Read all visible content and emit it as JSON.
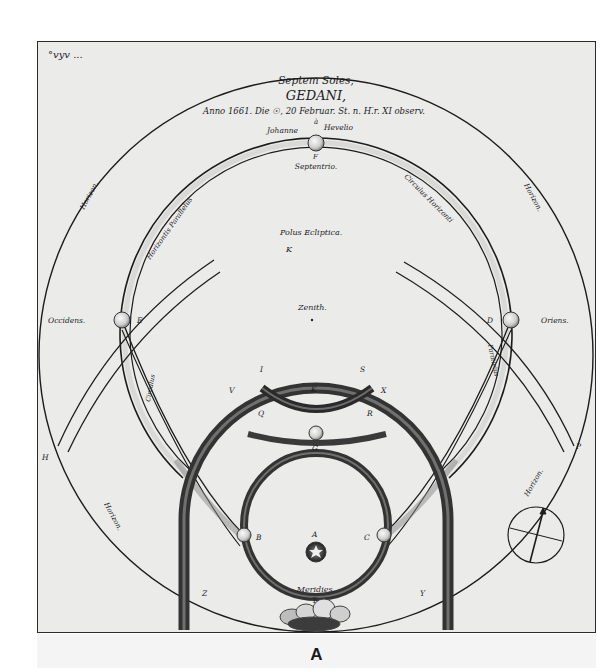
{
  "figure": {
    "caption": "A",
    "corner_inscription": "°vyv ...",
    "title": {
      "line1": "Septem Soles,",
      "line2": "GEDANI,",
      "line3": "Anno 1661. Die ☉, 20 Februar. St. n. H.̅r. XI observ.",
      "line4": "à",
      "author_left": "Johanne",
      "author_right": "Hevelio"
    },
    "labels": {
      "septentrio": "Septentrio.",
      "polus_ecliptica": "Polus Ecliptica.",
      "pole_symbol": "K",
      "zenith": "Zenith.",
      "occidens": "Occidens.",
      "oriens": "Oriens.",
      "meridies": "Meridies.",
      "horizon_upper_left": "Horizon.",
      "horizon_upper_right": "Horizon.",
      "horizon_lower_left": "Horizon.",
      "horizon_lower_right": "Horizon.",
      "horizontis_parallelus": "Horizontis Parallelus",
      "circulus_horizonti": "Circulus Horizonti",
      "circulus_left_lower": "Circulus",
      "parallelus_right_lower": "Parallelus"
    },
    "letters": {
      "top_sun": "F",
      "west_sun": "E",
      "east_sun": "D",
      "arc_left": "I",
      "arc_right": "S",
      "arc_mid": "K",
      "ring_left": "V",
      "ring_right": "X",
      "inner_left": "Q",
      "inner_right": "R",
      "center_sun": "G",
      "true_sun": "A",
      "left_parhelion": "B",
      "right_parhelion": "C",
      "lower_left": "Z",
      "lower_right": "Y",
      "far_left": "H",
      "far_right": "P",
      "meridies_letter": "T"
    },
    "colors": {
      "ink": "#1c1c1c",
      "paper": "#ebebea",
      "ring_dark": "#3a3a3a",
      "ring_shade": "#8a8a8a"
    }
  }
}
